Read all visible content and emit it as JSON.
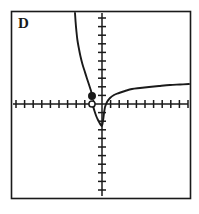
{
  "figure": {
    "panel_label": "D",
    "background_color": "#ffffff",
    "ink_color": "#1a1a1a",
    "frame": {
      "x": 11,
      "y": 11,
      "width": 179,
      "height": 187
    }
  },
  "chart_data": {
    "type": "line",
    "title": "D",
    "xlabel": "",
    "ylabel": "",
    "grid": false,
    "legend": null,
    "axes": {
      "origin_px": {
        "x": 102,
        "y": 104
      },
      "x_axis": {
        "from_px": 13,
        "to_px": 188,
        "y_px": 104,
        "tick_spacing_px": 8.6,
        "tick_half_length_px": 4
      },
      "y_axis": {
        "from_px": 13,
        "to_px": 196,
        "x_px": 102,
        "tick_spacing_px": 8.6,
        "tick_half_length_px": 4
      },
      "xlim": [
        -10.5,
        10
      ],
      "ylim": [
        -10.7,
        10.5
      ]
    },
    "ticks": {
      "x_negative_count": 10,
      "x_positive_count": 10,
      "y_positive_count": 10,
      "y_negative_count": 10,
      "labels_shown": false
    },
    "series": [
      {
        "name": "left-branch",
        "description": "Steeply decreasing curve entering from top frame edge, falling to a closed endpoint just above the x-axis left of the origin.",
        "style": "solid",
        "points_px": [
          [
            75,
            13
          ],
          [
            75.6,
            22
          ],
          [
            76.4,
            31
          ],
          [
            77.4,
            40
          ],
          [
            78.8,
            48
          ],
          [
            80.4,
            56
          ],
          [
            82.4,
            64
          ],
          [
            84.6,
            71
          ],
          [
            86.8,
            78
          ],
          [
            88.8,
            84
          ],
          [
            90.4,
            89
          ],
          [
            91.6,
            93
          ],
          [
            92.2,
            96
          ]
        ],
        "endpoint_closed_px": [
          92,
          96
        ]
      },
      {
        "name": "cusp-branch",
        "description": "Narrow V-shaped descent from the open endpoint on the x-axis down to a minimum just below the origin, then rising back to the origin.",
        "style": "solid",
        "points_px": [
          [
            93,
            106
          ],
          [
            94.5,
            111
          ],
          [
            96.2,
            116
          ],
          [
            98.0,
            120
          ],
          [
            99.6,
            123
          ],
          [
            100.8,
            125
          ],
          [
            101.6,
            126
          ],
          [
            102.2,
            125
          ],
          [
            102.8,
            122
          ],
          [
            103.4,
            118
          ],
          [
            104.0,
            113
          ],
          [
            104.8,
            108
          ]
        ]
      },
      {
        "name": "right-branch",
        "description": "Concave-down increasing curve rising from near the origin and flattening toward the right frame edge.",
        "style": "solid",
        "points_px": [
          [
            105,
            107
          ],
          [
            107,
            102
          ],
          [
            110,
            98
          ],
          [
            114,
            95
          ],
          [
            119,
            93
          ],
          [
            125,
            91
          ],
          [
            132,
            89
          ],
          [
            140,
            88
          ],
          [
            149,
            87
          ],
          [
            159,
            86
          ],
          [
            170,
            85
          ],
          [
            180,
            84.5
          ],
          [
            189,
            84
          ]
        ]
      }
    ],
    "markers": [
      {
        "name": "closed-endpoint",
        "kind": "filled-circle",
        "position_px": [
          92,
          96
        ],
        "radius_px": 3.4,
        "fill": "#1a1a1a",
        "stroke": "#1a1a1a"
      },
      {
        "name": "open-endpoint",
        "kind": "open-circle",
        "position_px": [
          92,
          104
        ],
        "radius_px": 3.4,
        "fill": "#ffffff",
        "stroke": "#1a1a1a"
      }
    ]
  }
}
